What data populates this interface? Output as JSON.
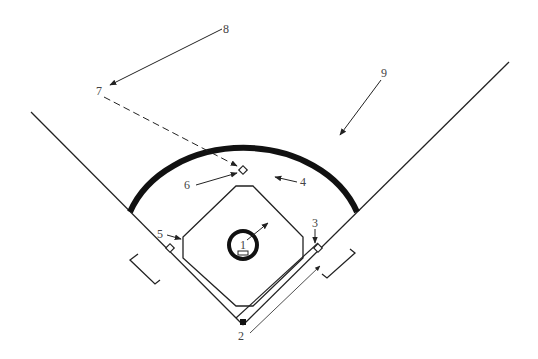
{
  "diagram": {
    "type": "softball/baseball field layout",
    "stroke_color": "#222222",
    "label_color": "#444444",
    "labels": [
      {
        "id": "1",
        "text": "1",
        "x": 240,
        "y": 248,
        "target": "pitcher's plate"
      },
      {
        "id": "2",
        "text": "2",
        "x": 240,
        "y": 340,
        "target": "home plate / baseline"
      },
      {
        "id": "3",
        "text": "3",
        "x": 313,
        "y": 227,
        "target": "first base"
      },
      {
        "id": "4",
        "text": "4",
        "x": 301,
        "y": 185,
        "target": "infield area"
      },
      {
        "id": "5",
        "text": "5",
        "x": 157,
        "y": 238,
        "target": "infield edge"
      },
      {
        "id": "6",
        "text": "6",
        "x": 185,
        "y": 188,
        "target": "second base"
      },
      {
        "id": "7",
        "text": "7",
        "x": 98,
        "y": 94,
        "target": "distance point"
      },
      {
        "id": "8",
        "text": "8",
        "x": 224,
        "y": 32,
        "target": "outfield point"
      },
      {
        "id": "9",
        "text": "9",
        "x": 383,
        "y": 76,
        "target": "outfield"
      }
    ]
  }
}
